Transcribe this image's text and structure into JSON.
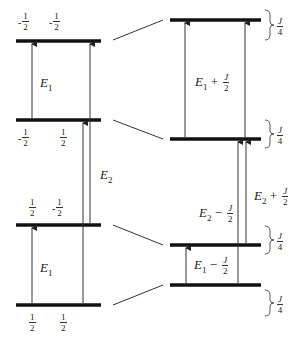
{
  "left_levels": [
    {
      "y": 41,
      "spins": [
        "-",
        "-"
      ],
      "spin_values": [
        "1",
        "1"
      ],
      "label_y": 13
    },
    {
      "y": 120,
      "spins": [
        "-",
        ""
      ],
      "spin_values": [
        "1",
        "1"
      ],
      "label_y": 130
    },
    {
      "y": 225,
      "spins": [
        "",
        "-"
      ],
      "spin_values": [
        "1",
        "1"
      ],
      "label_y": 196
    },
    {
      "y": 305,
      "spins": [
        "",
        ""
      ],
      "spin_values": [
        "1",
        "1"
      ],
      "label_y": 314
    }
  ],
  "spin_denominator": "2",
  "right_levels": [
    20,
    139,
    245,
    285
  ],
  "labels": {
    "e1_top": "E",
    "e1_top_sub": "1",
    "e2": "E",
    "e2_sub": "2",
    "e1_bottom": "E",
    "e1_bottom_sub": "1",
    "e1_plus": "E",
    "e1_plus_sub": "1",
    "e1_plus_op": " + ",
    "e2_minus": "E",
    "e2_minus_sub": "2",
    "e2_minus_op": " − ",
    "e2_plus": "E",
    "e2_plus_sub": "2",
    "e2_plus_op": " + ",
    "e1_minus": "E",
    "e1_minus_sub": "1",
    "e1_minus_op": " − ",
    "j": "J",
    "two": "2",
    "four": "4"
  },
  "braces": [
    {
      "label_num": "J",
      "label_den": "4"
    },
    {
      "label_num": "J",
      "label_den": "4"
    },
    {
      "label_num": "J",
      "label_den": "4"
    },
    {
      "label_num": "J",
      "label_den": "4"
    }
  ]
}
